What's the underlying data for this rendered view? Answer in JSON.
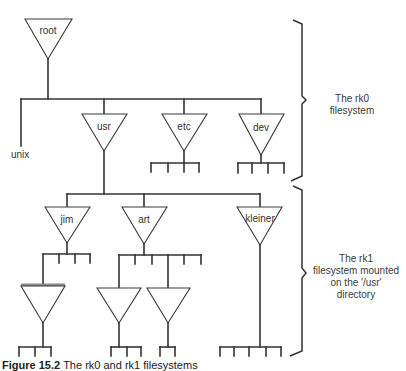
{
  "figure": {
    "caption_label": "Figure 15.2",
    "caption_text": "The rk0 and rk1 filesystems"
  },
  "nodes": {
    "root": "root",
    "unix": "unix",
    "usr": "usr",
    "etc": "etc",
    "dev": "dev",
    "jim": "jim",
    "art": "art",
    "kleiner": "kleiner"
  },
  "annotations": {
    "rk0": {
      "line1": "The rk0",
      "line2": "filesystem"
    },
    "rk1": {
      "line1": "The rk1",
      "line2": "filesystem mounted",
      "line3": "on the '/usr'",
      "line4": "directory"
    }
  }
}
